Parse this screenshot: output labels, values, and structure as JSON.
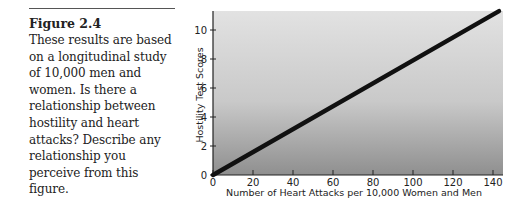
{
  "caption": {
    "title": "Figure 2.4",
    "body": "These results are based on a longitudinal study of 10,000 men and women. Is there a relationship between hostility and heart attacks? Describe any relationship you perceive from this figure."
  },
  "chart_data": {
    "type": "line",
    "title": "",
    "xlabel": "Number of Heart Attacks per 10,000 Women and Men",
    "ylabel": "Hostility Test Scores",
    "x_ticks": [
      0,
      20,
      40,
      60,
      80,
      100,
      120,
      140
    ],
    "y_ticks": [
      0,
      2,
      4,
      6,
      8,
      10
    ],
    "xlim": [
      0,
      145
    ],
    "ylim": [
      0,
      11.5
    ],
    "grid": false,
    "legend": null,
    "series": [
      {
        "name": "Hostility vs heart attacks",
        "x": [
          0,
          143
        ],
        "y": [
          0,
          11.3
        ]
      }
    ],
    "background": "vertical gradient light gray (top) to darker gray (bottom)",
    "line_color": "#111111"
  }
}
